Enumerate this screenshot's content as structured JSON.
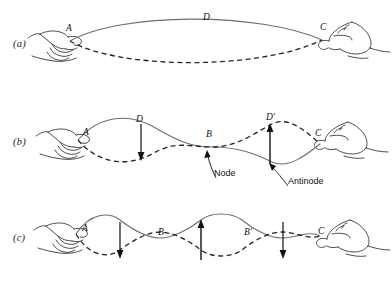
{
  "figure": {
    "width": 392,
    "height": 282,
    "background": "#ffffff",
    "ink_color": "#333333",
    "text_color": "#111111"
  },
  "panels": [
    {
      "id": "a",
      "label": "(a)",
      "description": "Fundamental mode: single loop between the two hands, no interior nodes",
      "loops": 1,
      "point_labels": [
        {
          "name": "A",
          "text": "A",
          "x": 66,
          "y": 23,
          "role": "left-hand-end"
        },
        {
          "name": "D",
          "text": "D",
          "x": 203,
          "y": 12,
          "role": "antinode-crest"
        },
        {
          "name": "C",
          "text": "C",
          "x": 320,
          "y": 22,
          "role": "right-hand-end"
        }
      ],
      "annotations": [],
      "arrows": []
    },
    {
      "id": "b",
      "label": "(b)",
      "description": "Second harmonic: two loops with one node at the midpoint",
      "loops": 2,
      "point_labels": [
        {
          "name": "A",
          "text": "A",
          "x": 83,
          "y": 127,
          "role": "left-hand-end"
        },
        {
          "name": "D",
          "text": "D",
          "x": 136,
          "y": 114,
          "role": "antinode-crest"
        },
        {
          "name": "B",
          "text": "B",
          "x": 206,
          "y": 129,
          "role": "node"
        },
        {
          "name": "D-prime",
          "text": "D'",
          "x": 266,
          "y": 112,
          "role": "antinode-crest"
        },
        {
          "name": "C",
          "text": "C",
          "x": 315,
          "y": 128,
          "role": "right-hand-end"
        }
      ],
      "annotations": [
        {
          "name": "node-label",
          "text": "Node",
          "x": 214,
          "y": 168
        },
        {
          "name": "antinode-label",
          "text": "Antinode",
          "x": 288,
          "y": 176
        }
      ],
      "arrows": [
        {
          "name": "down-arrow-1",
          "direction": "down",
          "x": 141,
          "y_from": 124,
          "y_to": 158
        },
        {
          "name": "up-arrow-1",
          "direction": "up",
          "x": 270,
          "y_from": 162,
          "y_to": 124
        }
      ]
    },
    {
      "id": "c",
      "label": "(c)",
      "description": "Third harmonic: three loops with two interior nodes",
      "loops": 3,
      "point_labels": [
        {
          "name": "A",
          "text": "A",
          "x": 82,
          "y": 223,
          "role": "left-hand-end"
        },
        {
          "name": "B",
          "text": "B",
          "x": 158,
          "y": 227,
          "role": "node"
        },
        {
          "name": "B-prime",
          "text": "B'",
          "x": 244,
          "y": 227,
          "role": "node"
        },
        {
          "name": "C",
          "text": "C",
          "x": 318,
          "y": 226,
          "role": "right-hand-end"
        }
      ],
      "annotations": [],
      "arrows": [
        {
          "name": "down-arrow-1",
          "direction": "down",
          "x": 120,
          "y_from": 229,
          "y_to": 262
        },
        {
          "name": "up-arrow-1",
          "direction": "up",
          "x": 201,
          "y_from": 263,
          "y_to": 229
        },
        {
          "name": "down-arrow-2",
          "direction": "down",
          "x": 283,
          "y_from": 229,
          "y_to": 262
        }
      ]
    }
  ]
}
